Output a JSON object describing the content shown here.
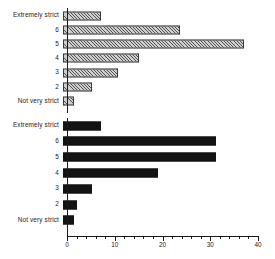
{
  "chart_data": {
    "type": "bar",
    "orientation": "horizontal",
    "title": "",
    "xlabel": "",
    "ylabel": "",
    "xlim": [
      0,
      40
    ],
    "xticks": [
      0,
      10,
      20,
      30,
      40
    ],
    "xtick_labels": [
      "0",
      "10",
      "20",
      "30",
      "40"
    ],
    "minor_tick_step": 2,
    "grid": false,
    "legend": "none",
    "categories": [
      "Extremely strict",
      "6",
      "5",
      "4",
      "3",
      "2",
      "Not very strict"
    ],
    "panels": [
      {
        "name": "upper-panel",
        "fill": "hatched-gray",
        "fill_color": "#cfcfcf",
        "edge_color": "#3a3a3a",
        "values": [
          8,
          24.5,
          38,
          16,
          11.5,
          6,
          2.3
        ]
      },
      {
        "name": "lower-panel",
        "fill": "solid-black",
        "fill_color": "#131313",
        "edge_color": "#131313",
        "values": [
          8,
          32,
          32,
          19.8,
          6,
          3,
          2.3
        ]
      }
    ]
  },
  "axis": {
    "tick_labels": [
      "0",
      "10",
      "20",
      "30",
      "40"
    ]
  },
  "categories": {
    "top": [
      "Extremely strict",
      "6",
      "5",
      "4",
      "3",
      "2",
      "Not very strict"
    ],
    "bottom": [
      "Extremely strict",
      "6",
      "5",
      "4",
      "3",
      "2",
      "Not very strict"
    ]
  }
}
